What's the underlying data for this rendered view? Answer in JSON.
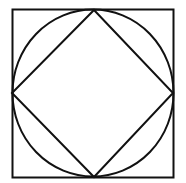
{
  "diagram": {
    "stroke_color": "#111111",
    "background": "#ffffff",
    "outer_square": {
      "x": 12.5,
      "y": 9.5,
      "width": 161,
      "height": 168
    },
    "circle": {
      "cx": 93,
      "cy": 93,
      "rx": 80.5,
      "ry": 83.5
    },
    "diamond": {
      "points": "94,10 173,93 94,177 12,93"
    }
  }
}
